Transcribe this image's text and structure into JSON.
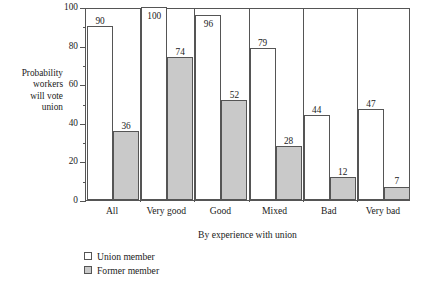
{
  "chart_data": {
    "type": "bar",
    "title": "",
    "xlabel": "By experience with union",
    "ylabel": "Probability workers will vote union",
    "ylabel_lines": [
      "Probability",
      "workers",
      "will vote",
      "union"
    ],
    "categories": [
      "All",
      "Very good",
      "Good",
      "Mixed",
      "Bad",
      "Very bad"
    ],
    "series": [
      {
        "name": "Union member",
        "values": [
          90,
          100,
          96,
          79,
          44,
          47
        ],
        "color": "#ffffff"
      },
      {
        "name": "Former member",
        "values": [
          36,
          74,
          52,
          28,
          12,
          7
        ],
        "color": "#c9c9c9"
      }
    ],
    "ylim": [
      0,
      100
    ],
    "ytick_labels": [
      "0",
      "20",
      "40",
      "60",
      "80",
      "100"
    ],
    "ytick_values": [
      0,
      20,
      40,
      60,
      80,
      100
    ],
    "yminor_values": [
      10,
      30,
      50,
      70,
      90
    ],
    "grid": false,
    "legend_position": "below-left",
    "axis_color": "#555555",
    "data_labels": true
  },
  "legend": {
    "items": [
      {
        "label": "Union member",
        "swatch": "union"
      },
      {
        "label": "Former member",
        "swatch": "former"
      }
    ]
  }
}
